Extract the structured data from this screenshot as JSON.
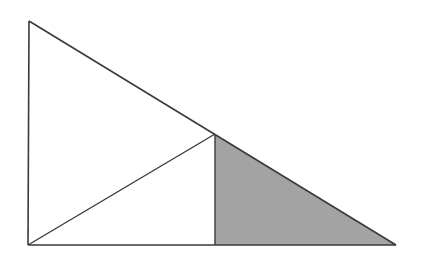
{
  "diagram": {
    "type": "geometry",
    "colors": {
      "stroke": "#3a3a3a",
      "shade": "#a3a3a3",
      "background": "#ffffff"
    },
    "points": {
      "A": {
        "x": 29,
        "y": 21
      },
      "B": {
        "x": 28,
        "y": 245
      },
      "C": {
        "x": 396,
        "y": 245
      },
      "D": {
        "x": 215,
        "y": 134
      },
      "E": {
        "x": 215,
        "y": 245
      }
    },
    "segments": [
      {
        "from": "A",
        "to": "B"
      },
      {
        "from": "B",
        "to": "C"
      },
      {
        "from": "A",
        "to": "C"
      },
      {
        "from": "B",
        "to": "D"
      },
      {
        "from": "D",
        "to": "E"
      }
    ],
    "shaded_region": [
      "D",
      "E",
      "C"
    ]
  }
}
